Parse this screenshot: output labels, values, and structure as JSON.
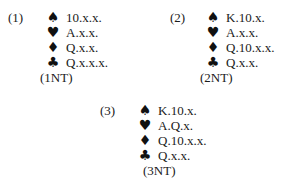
{
  "hands": [
    {
      "label": "(1)",
      "suits": [
        {
          "icon": "spade-icon",
          "glyph": "♠",
          "holding": "10.x.x."
        },
        {
          "icon": "heart-icon",
          "glyph": "♥",
          "holding": "A.x.x."
        },
        {
          "icon": "diamond-icon",
          "glyph": "♦",
          "holding": "Q.x.x."
        },
        {
          "icon": "club-icon",
          "glyph": "♣",
          "holding": "Q.x.x.x."
        }
      ],
      "contract": "(1NT)"
    },
    {
      "label": "(2)",
      "suits": [
        {
          "icon": "spade-icon",
          "glyph": "♠",
          "holding": "K.10.x."
        },
        {
          "icon": "heart-icon",
          "glyph": "♥",
          "holding": "A.x.x."
        },
        {
          "icon": "diamond-icon",
          "glyph": "♦",
          "holding": "Q.10.x.x."
        },
        {
          "icon": "club-icon",
          "glyph": "♣",
          "holding": "Q.x.x."
        }
      ],
      "contract": "(2NT)"
    },
    {
      "label": "(3)",
      "suits": [
        {
          "icon": "spade-icon",
          "glyph": "♠",
          "holding": "K.10.x."
        },
        {
          "icon": "heart-icon",
          "glyph": "♥",
          "holding": "A.Q.x."
        },
        {
          "icon": "diamond-icon",
          "glyph": "♦",
          "holding": "Q.10.x.x."
        },
        {
          "icon": "club-icon",
          "glyph": "♣",
          "holding": "Q.x.x."
        }
      ],
      "contract": "(3NT)"
    }
  ]
}
